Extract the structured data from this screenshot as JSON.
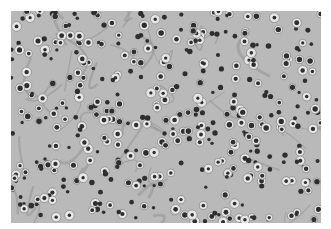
{
  "image": {
    "description": "Grayscale histology micrograph of densely packed round cells with dark nuclei and pale perinuclear halos in a fibrillary background",
    "background_color": "#ffffff",
    "tissue_color": "#b9b9b9",
    "nucleus_color": "#2e2e2e",
    "halo_color": "#e6e6e6"
  }
}
